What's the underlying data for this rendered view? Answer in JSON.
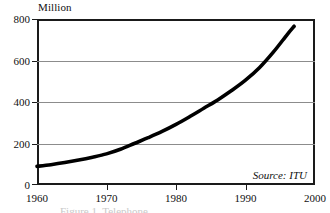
{
  "figure": {
    "unit_title": "Million",
    "source_note": "Source: ITU",
    "caption": "Figure 1. Telephone"
  },
  "chart_data": {
    "type": "line",
    "title": "Million",
    "xlabel": "",
    "ylabel": "Million",
    "xlim": [
      1960,
      2000
    ],
    "ylim": [
      0,
      800
    ],
    "grid": true,
    "gridlines_y": [
      200,
      400,
      600
    ],
    "legend": "none",
    "annotations": [
      "Source: ITU"
    ],
    "xticks": [
      1960,
      1970,
      1980,
      1990,
      2000
    ],
    "xtick_labels": [
      "1960",
      "1970",
      "1980",
      "1990",
      "2000"
    ],
    "yticks": [
      0,
      200,
      400,
      600,
      800
    ],
    "ytick_labels": [
      "0",
      "200",
      "400",
      "600",
      "800"
    ],
    "series": [
      {
        "name": "Telephone lines",
        "x": [
          1960,
          1962,
          1964,
          1966,
          1968,
          1970,
          1972,
          1974,
          1976,
          1978,
          1980,
          1982,
          1984,
          1986,
          1988,
          1990,
          1992,
          1994,
          1996,
          1997
        ],
        "values": [
          90,
          98,
          108,
          120,
          134,
          150,
          172,
          200,
          228,
          258,
          292,
          330,
          370,
          410,
          455,
          505,
          565,
          640,
          725,
          765
        ]
      }
    ]
  }
}
